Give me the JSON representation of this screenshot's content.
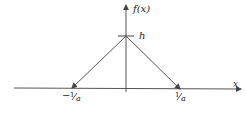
{
  "diagram": {
    "type": "triangular-function-plot",
    "y_axis_label": "f(x)",
    "x_axis_label": "x",
    "peak_label": "h",
    "left_tick_label_sign": "−",
    "left_tick_label_num": "1",
    "left_tick_label_den": "a",
    "right_tick_label_num": "1",
    "right_tick_label_den": "a",
    "colors": {
      "line": "#444444",
      "text": "#222222",
      "background": "#ffffff"
    }
  }
}
